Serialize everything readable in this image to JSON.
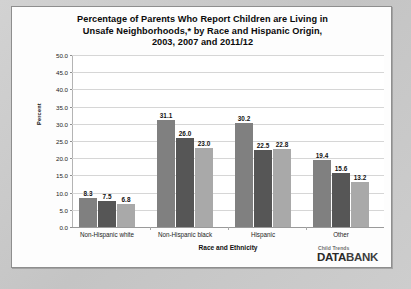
{
  "chart_data": {
    "type": "bar",
    "title": "Percentage of Parents Who Report Children are Living in Unsafe Neighborhoods,* by Race and Hispanic Origin, 2003, 2007 and 2011/12",
    "title_lines": [
      "Percentage of Parents Who Report Children are Living in",
      "Unsafe Neighborhoods,* by Race and Hispanic Origin,",
      "2003, 2007 and 2011/12"
    ],
    "xlabel": "Race and Ethnicity",
    "ylabel": "Percent",
    "ylim": [
      0,
      50
    ],
    "ytick_step": 5,
    "ytick_labels": [
      "50.0",
      "45.0",
      "40.0",
      "35.0",
      "30.0",
      "25.0",
      "20.0",
      "15.0",
      "10.0",
      "5.0",
      "0.0"
    ],
    "grid": true,
    "legend_position": "top-center",
    "categories": [
      "Non-Hispanic white",
      "Non-Hispanic black",
      "Hispanic",
      "Other"
    ],
    "series": [
      {
        "name": "2003",
        "color": "#808080",
        "values": [
          8.3,
          31.1,
          30.2,
          19.4
        ]
      },
      {
        "name": "2007",
        "color": "#565656",
        "values": [
          7.5,
          26.0,
          22.5,
          15.6
        ]
      },
      {
        "name": "2011/12",
        "color": "#a9a9a9",
        "values": [
          6.8,
          23.0,
          22.8,
          13.2
        ]
      }
    ]
  },
  "logo": {
    "top": "Child Trends",
    "main_left": "DATA",
    "main_right": "BANK"
  }
}
